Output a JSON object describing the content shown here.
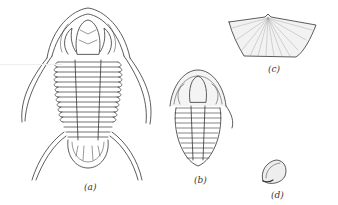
{
  "figure": {
    "panels": [
      {
        "id": "a",
        "label": "(a)",
        "subject": "large trilobite with long genal spines and pygidial spines"
      },
      {
        "id": "b",
        "label": "(b)",
        "subject": "small trilobite"
      },
      {
        "id": "c",
        "label": "(c)",
        "subject": "brachiopod shell (strophomenid, ribbed)"
      },
      {
        "id": "d",
        "label": "(d)",
        "subject": "small rounded shell"
      }
    ],
    "colors": {
      "ink": "#333333",
      "shade": "#cfcfcf",
      "background": "#ffffff"
    }
  }
}
